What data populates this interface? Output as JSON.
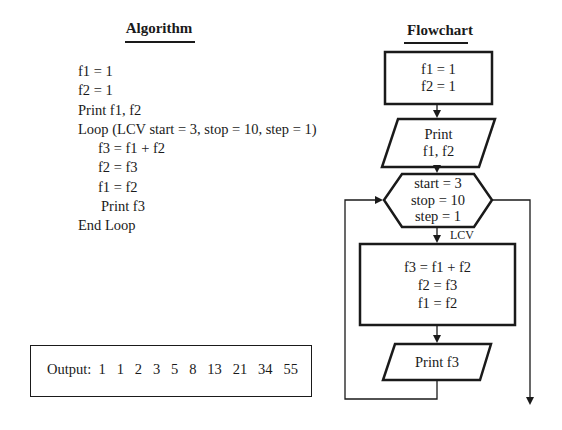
{
  "algorithm": {
    "title": "Algorithm",
    "lines": [
      {
        "text": "f1 = 1",
        "indent": 0
      },
      {
        "text": "f2 = 1",
        "indent": 0
      },
      {
        "text": "Print f1, f2",
        "indent": 0
      },
      {
        "text": "Loop (LCV start = 3, stop = 10, step = 1)",
        "indent": 0
      },
      {
        "text": "f3 = f1 + f2",
        "indent": 1
      },
      {
        "text": "f2 = f3",
        "indent": 1
      },
      {
        "text": "f1 = f2",
        "indent": 1
      },
      {
        "text": "Print f3",
        "indent": 2
      },
      {
        "text": "End Loop",
        "indent": 0
      }
    ]
  },
  "output": {
    "label": "Output:",
    "values": "1  1  2  3  5  8  13  21  34  55",
    "full": "Output:  1   1   2   3   5   8   13   21   34   55"
  },
  "flowchart": {
    "title": "Flowchart",
    "init_box": {
      "line1": "f1 = 1",
      "line2": "f2 = 1"
    },
    "print_io": {
      "line1": "Print",
      "line2": "f1, f2"
    },
    "loop_hex": {
      "line1": "start = 3",
      "line2": "stop = 10",
      "line3": "step = 1"
    },
    "loop_label": "LCV",
    "body_box": {
      "line1": "f3 = f1 + f2",
      "line2": "f2 = f3",
      "line3": "f1 = f2"
    },
    "print_f3": "Print f3"
  }
}
